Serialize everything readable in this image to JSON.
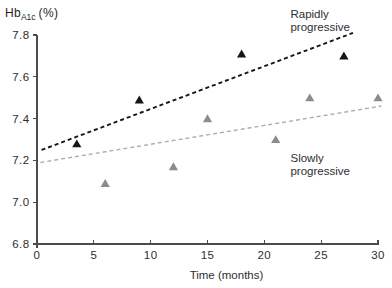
{
  "figure": {
    "y_axis_title": {
      "main": "Hb",
      "sub": "A1c",
      "suffix": "(%)"
    }
  },
  "chart_data": {
    "type": "scatter",
    "title": "",
    "xlabel": "Time (months)",
    "ylabel": "HbA1c (%)",
    "xlim": [
      0,
      30
    ],
    "ylim": [
      6.8,
      7.8
    ],
    "xticks": [
      0,
      5,
      10,
      15,
      20,
      25,
      30
    ],
    "yticks": [
      6.8,
      7.0,
      7.2,
      7.4,
      7.6,
      7.8
    ],
    "grid": false,
    "legend_position": "annotations-inside-plot",
    "series": [
      {
        "name": "Rapidly progressive",
        "marker": "filled-triangle",
        "color": "#161616",
        "points": [
          [
            3.5,
            7.28
          ],
          [
            9,
            7.49
          ],
          [
            18,
            7.71
          ],
          [
            27,
            7.7
          ]
        ],
        "trendline": {
          "style": "dashed",
          "color": "#161616",
          "width": 1.9,
          "from": [
            0.4,
            7.25
          ],
          "to": [
            27.8,
            7.81
          ]
        },
        "annotation": {
          "lines": [
            "Rapidly",
            "progressive"
          ],
          "x": 22.3,
          "y": 7.9
        }
      },
      {
        "name": "Slowly progressive",
        "marker": "filled-triangle",
        "color": "#8c8c8c",
        "points": [
          [
            6,
            7.09
          ],
          [
            12,
            7.17
          ],
          [
            15,
            7.4
          ],
          [
            21,
            7.3
          ],
          [
            24,
            7.5
          ],
          [
            30,
            7.5
          ]
        ],
        "trendline": {
          "style": "dashed",
          "color": "#adadad",
          "width": 1.4,
          "from": [
            0.3,
            7.19
          ],
          "to": [
            30.3,
            7.46
          ]
        },
        "annotation": {
          "lines": [
            "Slowly",
            "progressive"
          ],
          "x": 22.3,
          "y": 7.21
        }
      }
    ]
  }
}
